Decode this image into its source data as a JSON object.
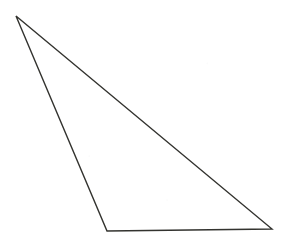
{
  "figure": {
    "type": "line-drawing",
    "subject": "triangle",
    "description": "Outline of a scalene triangle drawn with thin dark lines on a plain white background",
    "canvas": {
      "width": 288,
      "height": 244
    },
    "background_color": "#ffffff",
    "stroke_color": "#33332f",
    "stroke_width": 1.4,
    "fill": "none",
    "vertices": [
      {
        "name": "apex-top-left",
        "x": 16,
        "y": 16
      },
      {
        "name": "vertex-bottom-left",
        "x": 107,
        "y": 231
      },
      {
        "name": "vertex-bottom-right",
        "x": 272,
        "y": 229
      }
    ],
    "points_attr": "16,16 107,231 272,229",
    "edges": [
      {
        "name": "left-edge",
        "from": "apex-top-left",
        "to": "vertex-bottom-left"
      },
      {
        "name": "bottom-edge",
        "from": "vertex-bottom-left",
        "to": "vertex-bottom-right"
      },
      {
        "name": "hypotenuse-edge",
        "from": "vertex-bottom-right",
        "to": "apex-top-left"
      }
    ]
  }
}
